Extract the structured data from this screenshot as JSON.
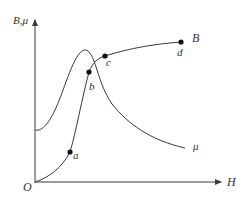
{
  "diagram": {
    "type": "magnetization-curve",
    "colors": {
      "line": "#3a3a3a",
      "axis": "#3a3a3a",
      "text": "#333333",
      "point": "#111111"
    },
    "axes": {
      "y_label": "B,μ",
      "x_label": "H",
      "origin_label": "O"
    },
    "curves": [
      {
        "name": "B",
        "label": "B"
      },
      {
        "name": "mu",
        "label": "μ"
      }
    ],
    "points": [
      {
        "id": "a",
        "label": "a"
      },
      {
        "id": "b",
        "label": "b"
      },
      {
        "id": "c",
        "label": "c"
      },
      {
        "id": "d",
        "label": "d"
      }
    ]
  }
}
